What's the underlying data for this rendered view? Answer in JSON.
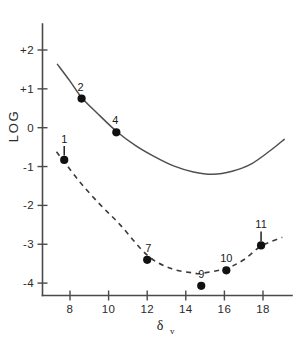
{
  "chart_data": {
    "type": "line",
    "title": "",
    "xlabel": "δv",
    "ylabel": "LOG",
    "xlim": [
      6.6,
      19.4
    ],
    "ylim": [
      -4.45,
      2.5
    ],
    "grid": false,
    "legend": "none",
    "xticks": [
      8,
      10,
      12,
      14,
      16,
      18
    ],
    "xticklabels": [
      "8",
      "10",
      "12",
      "14",
      "16",
      "18"
    ],
    "yticks": [
      2,
      1,
      0,
      -1,
      -2,
      -3,
      -4
    ],
    "yticklabels": [
      "+2",
      "+1",
      "0",
      "-1",
      "-2",
      "-3",
      "-4"
    ],
    "series": [
      {
        "name": "upper-solid-curve",
        "style": "solid",
        "marker": "none",
        "x": [
          7.35,
          8.0,
          8.6,
          9.4,
          10.4,
          11.4,
          12.4,
          13.4,
          14.4,
          15.4,
          16.4,
          17.4,
          18.4,
          19.1
        ],
        "y": [
          1.63,
          1.2,
          0.78,
          0.38,
          -0.09,
          -0.46,
          -0.75,
          -0.99,
          -1.14,
          -1.2,
          -1.12,
          -0.93,
          -0.58,
          -0.3
        ]
      },
      {
        "name": "lower-dashed-curve",
        "style": "dashed",
        "marker": "none",
        "x": [
          7.3,
          7.7,
          8.6,
          9.6,
          10.6,
          12.0,
          13.2,
          14.4,
          14.8,
          16.1,
          17.0,
          17.9,
          19.0
        ],
        "y": [
          -0.62,
          -0.88,
          -1.45,
          -2.0,
          -2.5,
          -3.28,
          -3.62,
          -3.74,
          -3.75,
          -3.62,
          -3.4,
          -3.05,
          -2.82
        ]
      }
    ],
    "points": [
      {
        "label": "1",
        "x": 7.7,
        "y": -0.83,
        "series": "lower-dashed-curve",
        "label_pos": "above",
        "errorbar": "up"
      },
      {
        "label": "2",
        "x": 8.6,
        "y": 0.75,
        "series": "upper-solid-curve",
        "label_pos": "above-left",
        "errorbar": "none"
      },
      {
        "label": "4",
        "x": 10.4,
        "y": -0.12,
        "series": "upper-solid-curve",
        "label_pos": "above-left",
        "errorbar": "none"
      },
      {
        "label": "7",
        "x": 12.0,
        "y": -3.4,
        "series": "lower-dashed-curve",
        "label_pos": "above-right",
        "errorbar": "none"
      },
      {
        "label": "9",
        "x": 14.8,
        "y": -4.07,
        "series": "lower-dashed-curve",
        "label_pos": "above",
        "errorbar": "none"
      },
      {
        "label": "10",
        "x": 16.1,
        "y": -3.67,
        "series": "lower-dashed-curve",
        "label_pos": "above",
        "errorbar": "none"
      },
      {
        "label": "11",
        "x": 17.9,
        "y": -3.03,
        "series": "lower-dashed-curve",
        "label_pos": "above",
        "errorbar": "up"
      }
    ]
  },
  "axes": {
    "y_title": "LOG",
    "x_title_base": "δ",
    "x_title_sub": "v"
  },
  "colors": {
    "axis": "#4a4a4a",
    "solid_curve": "#4f4f4f",
    "dashed_curve": "#3a3a3a",
    "marker": "#111111",
    "text": "#1a1a1a",
    "background": "#ffffff"
  }
}
